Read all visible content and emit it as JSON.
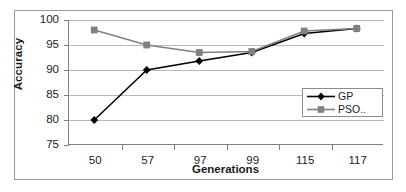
{
  "chart_data": {
    "type": "line",
    "title": "",
    "subtitle": "",
    "xlabel": "Generations",
    "ylabel": "Accuracy",
    "categories": [
      "50",
      "57",
      "97",
      "99",
      "115",
      "117"
    ],
    "ylim": [
      75,
      100
    ],
    "yticks": [
      "75",
      "80",
      "85",
      "90",
      "95",
      "100"
    ],
    "grid": true,
    "legend_position": "center-right",
    "series": [
      {
        "name": "GP",
        "marker": "diamond",
        "color": "#000000",
        "values": [
          80,
          90,
          91.8,
          93.5,
          97.3,
          98.3
        ]
      },
      {
        "name": "PSO..",
        "marker": "square",
        "color": "#808080",
        "values": [
          98,
          95,
          93.5,
          93.7,
          97.8,
          98.3
        ]
      }
    ]
  },
  "legend": {
    "entries": [
      {
        "label": "GP"
      },
      {
        "label": "PSO.."
      }
    ]
  },
  "colors": {
    "gp": "#000000",
    "pso": "#808080",
    "grid": "#b9b9b9",
    "axis": "#808080",
    "frame": "#9a9a9a",
    "text": "#1a1a1a"
  }
}
